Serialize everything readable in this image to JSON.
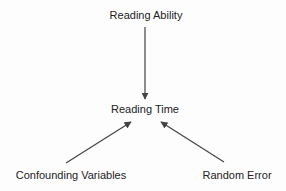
{
  "diagram": {
    "type": "causal-path-diagram",
    "nodes": [
      {
        "id": "reading_ability",
        "label": "Reading Ability"
      },
      {
        "id": "reading_time",
        "label": "Reading Time"
      },
      {
        "id": "confounding_variables",
        "label": "Confounding Variables"
      },
      {
        "id": "random_error",
        "label": "Random Error"
      }
    ],
    "edges": [
      {
        "from": "reading_ability",
        "to": "reading_time",
        "style": "arrow"
      },
      {
        "from": "confounding_variables",
        "to": "reading_time",
        "style": "arrow"
      },
      {
        "from": "random_error",
        "to": "reading_time",
        "style": "arrow"
      }
    ],
    "colors": {
      "text": "#222222",
      "edge": "#444444",
      "background": "#ffffff"
    }
  }
}
